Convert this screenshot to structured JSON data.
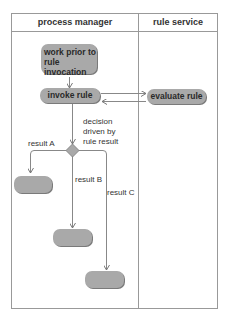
{
  "diagram": {
    "type": "uml-activity-swimlane",
    "lanes": [
      {
        "id": "process-manager",
        "label": "process manager"
      },
      {
        "id": "rule-service",
        "label": "rule service"
      }
    ],
    "nodes": [
      {
        "id": "work-prior",
        "label": "work prior to rule invocation",
        "lane": "process-manager"
      },
      {
        "id": "invoke-rule",
        "label": "invoke rule",
        "lane": "process-manager"
      },
      {
        "id": "evaluate-rule",
        "label": "evaluate rule",
        "lane": "rule-service"
      },
      {
        "id": "decision",
        "label": "",
        "shape": "diamond",
        "lane": "process-manager"
      },
      {
        "id": "result-a-node",
        "label": "",
        "lane": "process-manager"
      },
      {
        "id": "result-b-node",
        "label": "",
        "lane": "process-manager"
      },
      {
        "id": "result-c-node",
        "label": "",
        "lane": "process-manager"
      }
    ],
    "edges": [
      {
        "from": "work-prior",
        "to": "invoke-rule",
        "label": ""
      },
      {
        "from": "invoke-rule",
        "to": "evaluate-rule",
        "label": ""
      },
      {
        "from": "evaluate-rule",
        "to": "invoke-rule",
        "label": ""
      },
      {
        "from": "invoke-rule",
        "to": "decision",
        "label": ""
      },
      {
        "from": "decision",
        "to": "result-a-node",
        "label": "result A"
      },
      {
        "from": "decision",
        "to": "result-b-node",
        "label": "result B"
      },
      {
        "from": "decision",
        "to": "result-c-node",
        "label": "result C"
      }
    ],
    "annotations": {
      "decision_note_1": "decision",
      "decision_note_2": "driven by",
      "decision_note_3": "rule result"
    },
    "text": {
      "work_prior_1": "work prior to",
      "work_prior_2": "rule invocation",
      "invoke_rule": "invoke rule",
      "evaluate_rule": "evaluate rule",
      "result_a": "result A",
      "result_b": "result B",
      "result_c": "result C"
    },
    "colors": {
      "node_fill": "#a9a9a9",
      "line": "#888888",
      "text": "#333333"
    }
  }
}
